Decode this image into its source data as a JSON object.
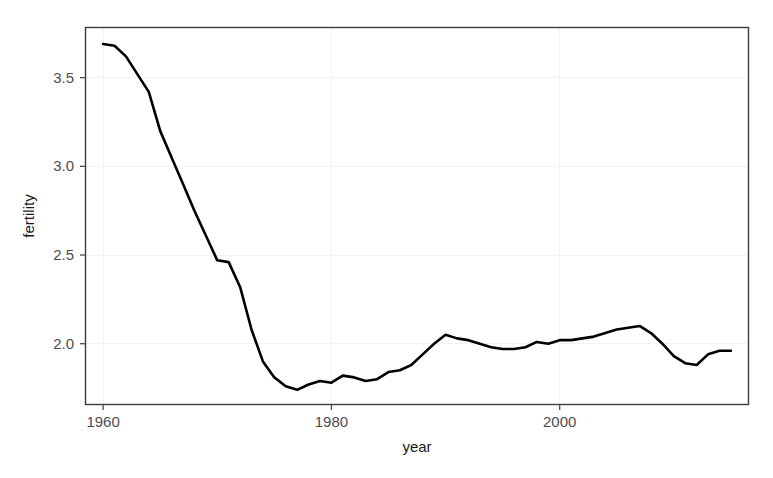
{
  "chart_data": {
    "type": "line",
    "title": "",
    "xlabel": "year",
    "ylabel": "fertility",
    "xlim": [
      1958.5,
      2016.5
    ],
    "ylim": [
      1.66,
      3.78
    ],
    "grid": true,
    "legend": "none",
    "xticks": [
      1960,
      1980,
      2000
    ],
    "xtick_labels": [
      "1960",
      "1980",
      "2000"
    ],
    "yticks": [
      2.0,
      2.5,
      3.0,
      3.5
    ],
    "ytick_labels": [
      "2.0",
      "2.5",
      "3.0",
      "3.5"
    ],
    "line_color": "#000000",
    "series": [
      {
        "name": "fertility",
        "x": [
          1960,
          1961,
          1962,
          1963,
          1964,
          1965,
          1966,
          1967,
          1968,
          1969,
          1970,
          1971,
          1972,
          1973,
          1974,
          1975,
          1976,
          1977,
          1978,
          1979,
          1980,
          1981,
          1982,
          1983,
          1984,
          1985,
          1986,
          1987,
          1988,
          1989,
          1990,
          1991,
          1992,
          1993,
          1994,
          1995,
          1996,
          1997,
          1998,
          1999,
          2000,
          2001,
          2002,
          2003,
          2004,
          2005,
          2006,
          2007,
          2008,
          2009,
          2010,
          2011,
          2012,
          2013,
          2014,
          2015
        ],
        "values": [
          3.69,
          3.68,
          3.62,
          3.52,
          3.42,
          3.2,
          3.05,
          2.9,
          2.75,
          2.61,
          2.47,
          2.46,
          2.32,
          2.08,
          1.9,
          1.81,
          1.76,
          1.74,
          1.77,
          1.79,
          1.78,
          1.82,
          1.81,
          1.79,
          1.8,
          1.84,
          1.85,
          1.88,
          1.94,
          2.0,
          2.05,
          2.03,
          2.02,
          2.0,
          1.98,
          1.97,
          1.97,
          1.98,
          2.01,
          2.0,
          2.02,
          2.02,
          2.03,
          2.04,
          2.06,
          2.08,
          2.09,
          2.1,
          2.06,
          2.0,
          1.93,
          1.89,
          1.88,
          1.94,
          1.96,
          1.96
        ]
      }
    ]
  },
  "axes": {
    "x_title": "year",
    "y_title": "fertility",
    "x_tick_labels": [
      "1960",
      "1980",
      "2000"
    ],
    "y_tick_labels": [
      "2.0",
      "2.5",
      "3.0",
      "3.5"
    ]
  },
  "colors": {
    "line": "#000000",
    "frame": "#3c3c3c",
    "grid": "#f2f2f2",
    "tick_text": "#4d4d4d",
    "axis_title_text": "#1a1a1a",
    "background": "#ffffff"
  }
}
